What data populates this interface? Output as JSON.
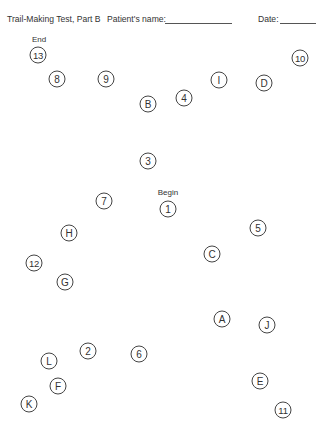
{
  "header": {
    "title": "Trail-Making Test, Part B",
    "patient_label": "Patient's name:",
    "patient_value": "",
    "date_label": "Date:",
    "date_value": ""
  },
  "labels": {
    "end": "End",
    "begin": "Begin"
  },
  "nodes": [
    {
      "text": "13",
      "x": 38,
      "y": 55
    },
    {
      "text": "8",
      "x": 57,
      "y": 79
    },
    {
      "text": "9",
      "x": 106,
      "y": 79
    },
    {
      "text": "10",
      "x": 300,
      "y": 58
    },
    {
      "text": "I",
      "x": 219,
      "y": 80
    },
    {
      "text": "D",
      "x": 264,
      "y": 83
    },
    {
      "text": "B",
      "x": 148,
      "y": 104
    },
    {
      "text": "4",
      "x": 184,
      "y": 98
    },
    {
      "text": "3",
      "x": 148,
      "y": 161
    },
    {
      "text": "1",
      "x": 168,
      "y": 209
    },
    {
      "text": "7",
      "x": 104,
      "y": 201
    },
    {
      "text": "5",
      "x": 258,
      "y": 228
    },
    {
      "text": "H",
      "x": 69,
      "y": 233
    },
    {
      "text": "C",
      "x": 212,
      "y": 254
    },
    {
      "text": "12",
      "x": 34,
      "y": 263
    },
    {
      "text": "G",
      "x": 65,
      "y": 282
    },
    {
      "text": "A",
      "x": 222,
      "y": 319
    },
    {
      "text": "J",
      "x": 267,
      "y": 325
    },
    {
      "text": "2",
      "x": 88,
      "y": 351
    },
    {
      "text": "6",
      "x": 139,
      "y": 354
    },
    {
      "text": "L",
      "x": 49,
      "y": 361
    },
    {
      "text": "F",
      "x": 58,
      "y": 386
    },
    {
      "text": "E",
      "x": 260,
      "y": 381
    },
    {
      "text": "K",
      "x": 29,
      "y": 404
    },
    {
      "text": "11",
      "x": 283,
      "y": 410
    }
  ]
}
